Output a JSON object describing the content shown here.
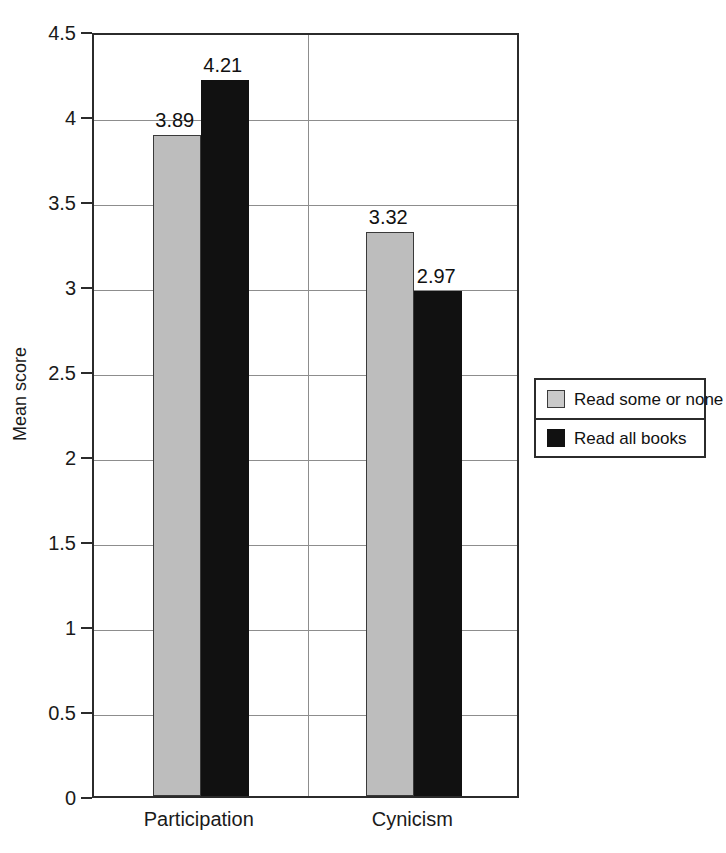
{
  "chart_data": {
    "type": "bar",
    "title": "",
    "subtitle": "",
    "xlabel": "",
    "ylabel": "Mean score",
    "ylim": [
      0,
      4.5
    ],
    "ytick_labels": [
      "0",
      "0.5",
      "1",
      "1.5",
      "2",
      "2.5",
      "3",
      "3.5",
      "4",
      "4.5"
    ],
    "ytick_values": [
      0,
      0.5,
      1,
      1.5,
      2,
      2.5,
      3,
      3.5,
      4,
      4.5
    ],
    "grid": "horizontal",
    "legend_position": "right",
    "categories": [
      "Participation",
      "Cynicism"
    ],
    "series": [
      {
        "name": "Read some or none",
        "color": "#bdbdbd",
        "values": [
          3.89,
          3.32
        ],
        "labels": [
          "3.89",
          "3.32"
        ]
      },
      {
        "name": "Read all books",
        "color": "#111111",
        "values": [
          4.21,
          2.97
        ],
        "labels": [
          "4.21",
          "2.97"
        ]
      }
    ]
  },
  "legend": {
    "entries": [
      {
        "label": "Read some or none",
        "swatch": "legend-swatch-gray"
      },
      {
        "label": "Read all books",
        "swatch": "legend-swatch-black"
      }
    ]
  },
  "axes": {
    "y_title": "Mean score"
  }
}
